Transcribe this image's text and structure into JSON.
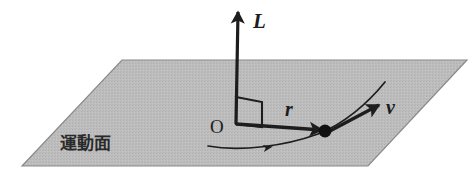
{
  "figure": {
    "background_color": "#ffffff",
    "width": 474,
    "height": 174
  },
  "plane": {
    "label": "運動面",
    "label_position": {
      "x": 60,
      "y": 149
    },
    "fill_color": "#b9b9b9",
    "edge_color": "#8a8a8a",
    "vertices": [
      {
        "x": 122,
        "y": 60
      },
      {
        "x": 467,
        "y": 60
      },
      {
        "x": 368,
        "y": 166
      },
      {
        "x": 22,
        "y": 166
      }
    ]
  },
  "origin": {
    "label": "O",
    "label_position": {
      "x": 210,
      "y": 133
    },
    "point": {
      "x": 236,
      "y": 124
    }
  },
  "vectors": [
    {
      "name": "angular-momentum",
      "label": "L",
      "label_position": {
        "x": 253,
        "y": 28
      },
      "start": {
        "x": 236,
        "y": 124
      },
      "end": {
        "x": 238,
        "y": 12
      },
      "color": "#1d1d1d",
      "stroke_width": 3.2
    },
    {
      "name": "position",
      "label": "r",
      "label_position": {
        "x": 285,
        "y": 116
      },
      "start": {
        "x": 236,
        "y": 124
      },
      "end": {
        "x": 322,
        "y": 130
      },
      "color": "#1d1d1d",
      "stroke_width": 3.4
    },
    {
      "name": "velocity",
      "label": "v",
      "label_position": {
        "x": 386,
        "y": 114
      },
      "start": {
        "x": 328,
        "y": 132
      },
      "end": {
        "x": 379,
        "y": 105
      },
      "color": "#1d1d1d",
      "stroke_width": 3.4
    }
  ],
  "particle": {
    "name": "particle",
    "center": {
      "x": 325,
      "y": 131
    },
    "radius": 6.5,
    "color": "#111111"
  },
  "right_angle_marker": {
    "name": "right-angle-marker",
    "color": "#1d1d1d",
    "points": "236,97 262,102 262,127 236,124"
  },
  "trajectory": {
    "name": "trajectory-curve",
    "color": "#1d1d1d",
    "stroke_width": 1.7,
    "path": "M 208 146 C 240 152 285 146 318 134 C 344 124 368 103 385 82",
    "direction_arrow": {
      "position": {
        "x": 271,
        "y": 147
      },
      "rotation_deg": -11
    }
  }
}
